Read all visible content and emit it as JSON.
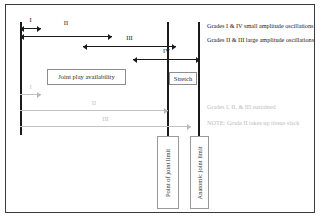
{
  "diagram": {
    "colors": {
      "line": "#1a1a1a",
      "sustained": "#c2c2c2",
      "border": "#3b3b3b",
      "box_border": "#8d8d8d",
      "background": "#ffffff"
    },
    "reference_lines": [
      {
        "id": "resting-position",
        "label": ""
      },
      {
        "id": "point-of-joint-limit",
        "label": "Point of joint limit"
      },
      {
        "id": "anatomic-joint-limit",
        "label": "Anatomic joint limit"
      }
    ],
    "oscillation_arrows": [
      {
        "numeral": "I",
        "style": "black"
      },
      {
        "numeral": "II",
        "style": "black"
      },
      {
        "numeral": "III",
        "style": "black"
      },
      {
        "numeral": "IV",
        "style": "black"
      }
    ],
    "sustained_arrows": [
      {
        "numeral": "I",
        "style": "gray"
      },
      {
        "numeral": "II",
        "style": "gray"
      },
      {
        "numeral": "III",
        "style": "gray"
      }
    ],
    "boxes": {
      "joint_play": "Joint play availability",
      "stretch": "Stretch",
      "point_of_joint_limit": "Point of joint limit",
      "anatomic_joint_limit": "Anatomic joint limit"
    },
    "legend": {
      "oscillation": [
        "Grades I & IV small amplitude oscillations",
        "Grades II & III large amplitude oscillations"
      ],
      "sustained": [
        "Grades I, II, & III sustained",
        "NOTE: Grade II takes up tissue slack"
      ]
    }
  }
}
